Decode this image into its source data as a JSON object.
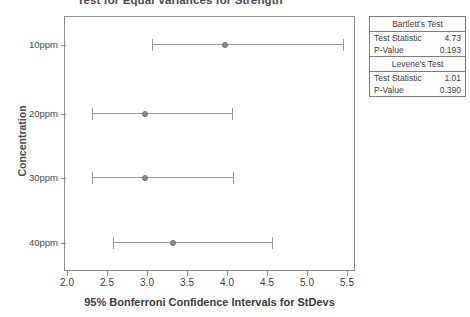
{
  "chart_data": {
    "type": "scatter",
    "title": "Test for Equal Variances for Strength",
    "xlabel": "95% Bonferroni Confidence Intervals for StDevs",
    "ylabel": "Concentration",
    "xlim": [
      2.0,
      5.5
    ],
    "grid": false,
    "legend": "none",
    "xticks": [
      "2.0",
      "2.5",
      "3.0",
      "3.5",
      "4.0",
      "4.5",
      "5.0",
      "5.5"
    ],
    "xtick_values": [
      2.0,
      2.5,
      3.0,
      3.5,
      4.0,
      4.5,
      5.0,
      5.5
    ],
    "categories": [
      "10ppm",
      "20ppm",
      "30ppm",
      "40ppm"
    ],
    "series": [
      {
        "name": "Bonferroni CI for StDev",
        "points": [
          {
            "category": "10ppm",
            "center": 3.97,
            "lower": 3.06,
            "upper": 5.45
          },
          {
            "category": "20ppm",
            "center": 2.98,
            "lower": 2.31,
            "upper": 4.06
          },
          {
            "category": "30ppm",
            "center": 2.98,
            "lower": 2.31,
            "upper": 4.08
          },
          {
            "category": "40ppm",
            "center": 3.32,
            "lower": 2.57,
            "upper": 4.56
          }
        ]
      }
    ],
    "annotations": [
      {
        "name": "Bartlett's Test",
        "test_statistic": 4.73,
        "p_value": 0.193
      },
      {
        "name": "Levene's Test",
        "test_statistic": 1.01,
        "p_value": 0.39
      }
    ]
  },
  "stats": {
    "bartlett": {
      "title": "Bartlett's Test",
      "stat_label": "Test Statistic",
      "stat_value": "4.73",
      "p_label": "P-Value",
      "p_value": "0.193"
    },
    "levene": {
      "title": "Levene's Test",
      "stat_label": "Test Statistic",
      "stat_value": "1.01",
      "p_label": "P-Value",
      "p_value": "0.390"
    }
  },
  "colors": {
    "axis": "#8d8d8d",
    "marker": "#8a8a8a",
    "interval": "#9a9a9a",
    "text": "#3c3c3c"
  }
}
